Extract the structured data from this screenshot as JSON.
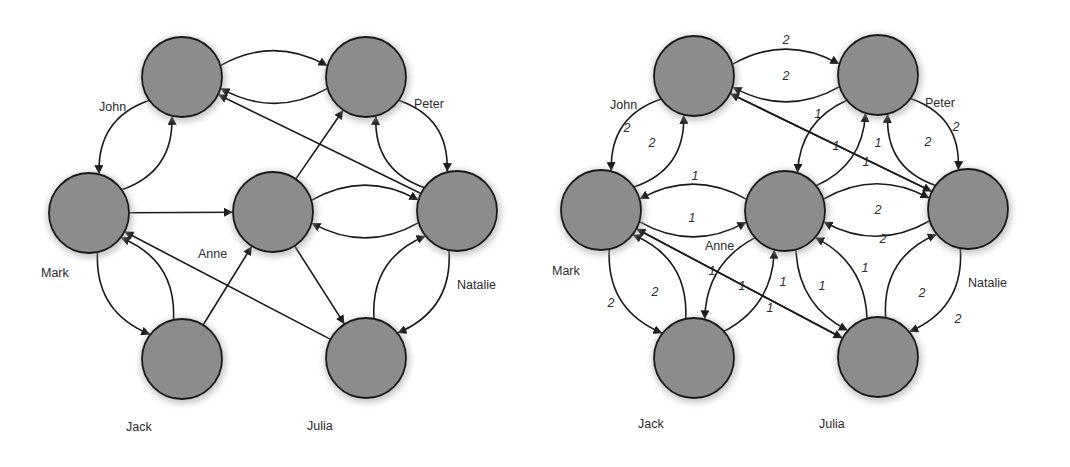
{
  "diagrams": [
    {
      "id": "unweighted",
      "offset_x": 0,
      "node_radius": 40,
      "nodes": [
        {
          "name": "John",
          "x": 182,
          "y": 77,
          "lx": 99,
          "ly": 111
        },
        {
          "name": "Peter",
          "x": 366,
          "y": 77,
          "lx": 414,
          "ly": 108
        },
        {
          "name": "Mark",
          "x": 89,
          "y": 213,
          "lx": 41,
          "ly": 277
        },
        {
          "name": "Anne",
          "x": 273,
          "y": 212,
          "lx": 198,
          "ly": 258
        },
        {
          "name": "Natalie",
          "x": 457,
          "y": 211,
          "lx": 457,
          "ly": 289
        },
        {
          "name": "Jack",
          "x": 182,
          "y": 359,
          "lx": 126,
          "ly": 431
        },
        {
          "name": "Julia",
          "x": 366,
          "y": 358,
          "lx": 307,
          "ly": 430
        }
      ],
      "edges": [
        {
          "from": "Peter",
          "to": "John",
          "bend": -0.18
        },
        {
          "from": "John",
          "to": "Peter",
          "bend": -0.18
        },
        {
          "from": "John",
          "to": "Mark",
          "bend": 0.22
        },
        {
          "from": "Mark",
          "to": "John",
          "bend": 0.22
        },
        {
          "from": "Natalie",
          "to": "John",
          "bend": 0
        },
        {
          "from": "Peter",
          "to": "Natalie",
          "bend": -0.22
        },
        {
          "from": "Natalie",
          "to": "Peter",
          "bend": -0.22
        },
        {
          "from": "Mark",
          "to": "Anne",
          "bend": 0
        },
        {
          "from": "Anne",
          "to": "Peter",
          "bend": 0
        },
        {
          "from": "Natalie",
          "to": "Anne",
          "bend": -0.18
        },
        {
          "from": "Anne",
          "to": "Natalie",
          "bend": -0.18
        },
        {
          "from": "Anne",
          "to": "Julia",
          "bend": 0
        },
        {
          "from": "Mark",
          "to": "Jack",
          "bend": 0.22
        },
        {
          "from": "Jack",
          "to": "Mark",
          "bend": 0.22
        },
        {
          "from": "Jack",
          "to": "Anne",
          "bend": 0
        },
        {
          "from": "Julia",
          "to": "Mark",
          "bend": 0
        },
        {
          "from": "Julia",
          "to": "Natalie",
          "bend": -0.22
        },
        {
          "from": "Natalie",
          "to": "Julia",
          "bend": -0.22
        }
      ]
    },
    {
      "id": "weighted",
      "offset_x": 0,
      "node_radius": 40,
      "nodes": [
        {
          "name": "John",
          "x": 694,
          "y": 76,
          "lx": 610,
          "ly": 109
        },
        {
          "name": "Peter",
          "x": 878,
          "y": 75,
          "lx": 925,
          "ly": 107
        },
        {
          "name": "Mark",
          "x": 601,
          "y": 210,
          "lx": 552,
          "ly": 275
        },
        {
          "name": "Anne",
          "x": 785,
          "y": 211,
          "lx": 705,
          "ly": 250
        },
        {
          "name": "Natalie",
          "x": 968,
          "y": 209,
          "lx": 968,
          "ly": 287
        },
        {
          "name": "Jack",
          "x": 694,
          "y": 358,
          "lx": 638,
          "ly": 428
        },
        {
          "name": "Julia",
          "x": 878,
          "y": 357,
          "lx": 819,
          "ly": 428
        }
      ],
      "edges": [
        {
          "from": "Peter",
          "to": "John",
          "bend": -0.18,
          "weight": "2",
          "wx": 786,
          "wy": 44
        },
        {
          "from": "John",
          "to": "Peter",
          "bend": -0.18,
          "weight": "2",
          "wx": 786,
          "wy": 80
        },
        {
          "from": "John",
          "to": "Mark",
          "bend": 0.22,
          "weight": "2",
          "wx": 627,
          "wy": 132
        },
        {
          "from": "Mark",
          "to": "John",
          "bend": 0.22,
          "weight": "2",
          "wx": 652,
          "wy": 147
        },
        {
          "from": "John",
          "to": "Natalie",
          "bend": 0,
          "weight": "1",
          "wx": 878,
          "wy": 147
        },
        {
          "from": "Natalie",
          "to": "John",
          "bend": 0,
          "weight": "1",
          "wx": 866,
          "wy": 166
        },
        {
          "from": "Peter",
          "to": "Anne",
          "bend": 0.18,
          "weight": "1",
          "wx": 818,
          "wy": 118
        },
        {
          "from": "Anne",
          "to": "Peter",
          "bend": 0.18,
          "weight": "1",
          "wx": 836,
          "wy": 150
        },
        {
          "from": "Peter",
          "to": "Natalie",
          "bend": -0.22,
          "weight": "2",
          "wx": 956,
          "wy": 131
        },
        {
          "from": "Natalie",
          "to": "Peter",
          "bend": -0.22,
          "weight": "2",
          "wx": 928,
          "wy": 146
        },
        {
          "from": "Anne",
          "to": "Mark",
          "bend": 0.18,
          "weight": "1",
          "wx": 695,
          "wy": 180
        },
        {
          "from": "Mark",
          "to": "Anne",
          "bend": 0.18,
          "weight": "1",
          "wx": 692,
          "wy": 222
        },
        {
          "from": "Natalie",
          "to": "Anne",
          "bend": -0.18,
          "weight": "2",
          "wx": 878,
          "wy": 214
        },
        {
          "from": "Anne",
          "to": "Natalie",
          "bend": -0.18,
          "weight": "2",
          "wx": 883,
          "wy": 243
        },
        {
          "from": "Mark",
          "to": "Jack",
          "bend": 0.22,
          "weight": "2",
          "wx": 611,
          "wy": 307
        },
        {
          "from": "Jack",
          "to": "Mark",
          "bend": 0.22,
          "weight": "2",
          "wx": 655,
          "wy": 296
        },
        {
          "from": "Jack",
          "to": "Anne",
          "bend": 0.18,
          "weight": "1",
          "wx": 712,
          "wy": 275
        },
        {
          "from": "Anne",
          "to": "Jack",
          "bend": 0.18,
          "weight": "1",
          "wx": 742,
          "wy": 290
        },
        {
          "from": "Mark",
          "to": "Julia",
          "bend": 0,
          "weight": "1",
          "wx": 783,
          "wy": 286
        },
        {
          "from": "Julia",
          "to": "Mark",
          "bend": 0,
          "weight": "1",
          "wx": 770,
          "wy": 312
        },
        {
          "from": "Anne",
          "to": "Julia",
          "bend": 0.18,
          "weight": "1",
          "wx": 822,
          "wy": 290
        },
        {
          "from": "Julia",
          "to": "Anne",
          "bend": 0.18,
          "weight": "1",
          "wx": 865,
          "wy": 272
        },
        {
          "from": "Julia",
          "to": "Natalie",
          "bend": -0.22,
          "weight": "2",
          "wx": 922,
          "wy": 297
        },
        {
          "from": "Natalie",
          "to": "Julia",
          "bend": -0.22,
          "weight": "2",
          "wx": 958,
          "wy": 323
        }
      ]
    }
  ],
  "colors": {
    "node_fill": "#8c8c8c",
    "node_stroke": "#1a1a1a",
    "edge": "#1a1a1a",
    "label": "#2a2a2a",
    "background": "#ffffff"
  }
}
